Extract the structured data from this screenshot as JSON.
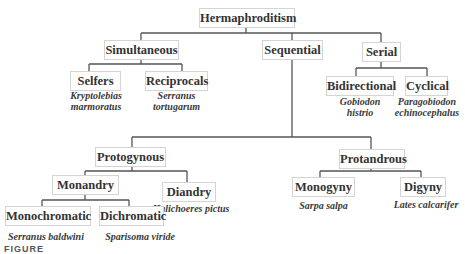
{
  "diagram": {
    "root": {
      "label": "Hermaphroditism"
    },
    "level1": {
      "simultaneous": {
        "label": "Simultaneous"
      },
      "sequential": {
        "label": "Sequential"
      },
      "serial": {
        "label": "Serial"
      }
    },
    "simultaneous_children": {
      "selfers": {
        "label": "Selfers",
        "species_line1": "Kryptolebias",
        "species_line2": "marmoratus"
      },
      "reciprocals": {
        "label": "Reciprocals",
        "species_line1": "Serranus",
        "species_line2": "tortugarum"
      }
    },
    "serial_children": {
      "bidirectional": {
        "label": "Bidirectional",
        "species_line1": "Gobiodon",
        "species_line2": "histrio"
      },
      "cyclical": {
        "label": "Cyclical",
        "species_line1": "Paragobiodon",
        "species_line2": "echinocephalus"
      }
    },
    "sequential_children": {
      "protogynous": {
        "label": "Protogynous"
      },
      "protandrous": {
        "label": "Protandrous"
      }
    },
    "protogynous_children": {
      "monandry": {
        "label": "Monandry"
      },
      "diandry": {
        "label": "Diandry",
        "species": "Halichoeres pictus"
      }
    },
    "monandry_children": {
      "monochromatic": {
        "label": "Monochromatic",
        "species": "Serranus baldwini"
      },
      "dichromatic": {
        "label": "Dichromatic",
        "species": "Sparisoma viride"
      }
    },
    "protandrous_children": {
      "monogyny": {
        "label": "Monogyny",
        "species": "Sarpa salpa"
      },
      "digyny": {
        "label": "Digyny",
        "species": "Lates calcarifer"
      }
    },
    "caption_fragment": "FIGURE"
  }
}
